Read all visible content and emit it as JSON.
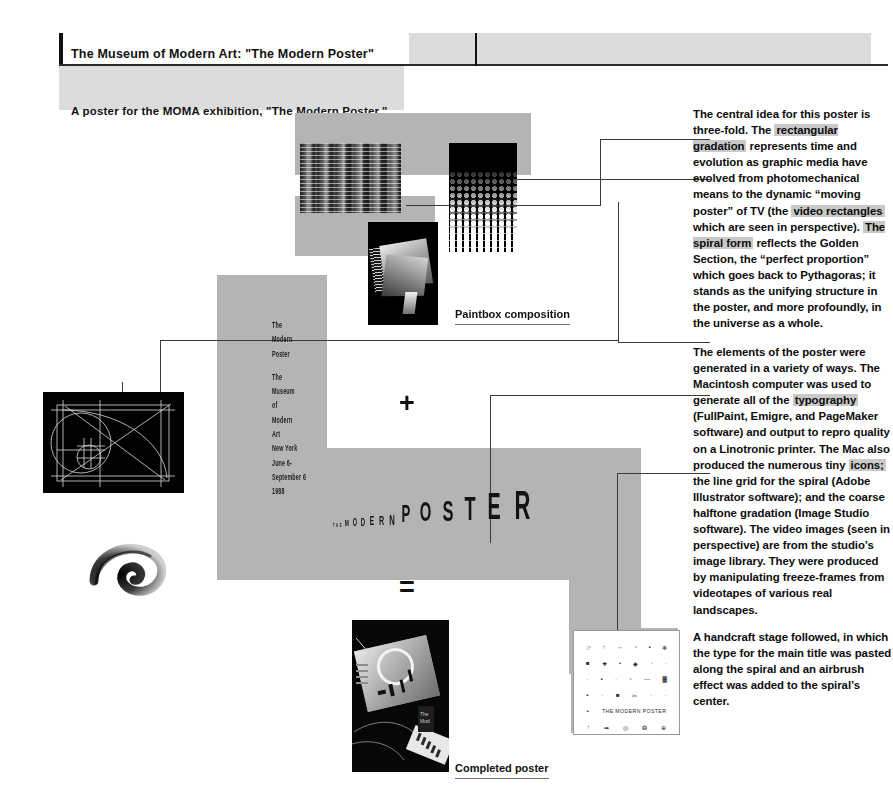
{
  "header": {
    "title": "The Museum of Modern Art: \"The Modern Poster\"",
    "subtitle": "A poster for the MOMA exhibition, \"The Modern Poster.\""
  },
  "body_text": {
    "paragraph_1": {
      "runs": [
        {
          "text": "The central idea for this poster is three-fold. The ",
          "highlight": false
        },
        {
          "text": "rectangular gradation",
          "highlight": true
        },
        {
          "text": " represents time and evolution as graphic media have evolved from photomechanical means to the dynamic “moving poster” of TV (the ",
          "highlight": false
        },
        {
          "text": "video rectangles",
          "highlight": true
        },
        {
          "text": " which are seen in perspective). ",
          "highlight": false
        },
        {
          "text": "The spiral form",
          "highlight": true
        },
        {
          "text": " reflects the Golden Section, the “perfect proportion” which goes back to Pythagoras; it stands as the unifying structure in the poster, and more profoundly, in the universe as a whole.",
          "highlight": false
        }
      ]
    },
    "paragraph_2": {
      "runs": [
        {
          "text": "The elements of the poster were generated in a variety of ways. The Macintosh computer was used to generate all of the ",
          "highlight": false
        },
        {
          "text": "typography",
          "highlight": true
        },
        {
          "text": " (FullPaint, Emigre, and PageMaker software) and output to repro quality on a Linotronic printer. The Mac also produced the numerous tiny ",
          "highlight": false
        },
        {
          "text": "icons;",
          "highlight": true
        },
        {
          "text": " the line grid for the spiral (Adobe Illustrator software); and the coarse halftone gradation (Image Studio software). The video images (seen in perspective) are from the studio’s image library. They were produced by manipulating freeze-frames from videotapes of various real landscapes.",
          "highlight": false
        }
      ]
    },
    "paragraph_3": {
      "runs": [
        {
          "text": "A handcraft stage followed, in which the type for the main title was pasted along the spiral and an airbrush effect was added to the spiral’s center.",
          "highlight": false
        }
      ]
    }
  },
  "poster": {
    "vertical_type_block_1": [
      "The",
      "Modern",
      "Poster"
    ],
    "vertical_type_block_2": [
      "The",
      "Museum",
      "of",
      "Modern",
      "Art",
      "New York",
      "June 6-",
      "September 6",
      "1988"
    ],
    "big_title_letters": [
      {
        "char": "T",
        "size": 5
      },
      {
        "char": "H",
        "size": 5
      },
      {
        "char": "E",
        "size": 5
      },
      {
        "char": "M",
        "size": 9
      },
      {
        "char": "O",
        "size": 10
      },
      {
        "char": "D",
        "size": 11
      },
      {
        "char": "E",
        "size": 12
      },
      {
        "char": "R",
        "size": 13
      },
      {
        "char": "N",
        "size": 14
      },
      {
        "char": "P",
        "size": 24
      },
      {
        "char": "O",
        "size": 27
      },
      {
        "char": "S",
        "size": 30
      },
      {
        "char": "T",
        "size": 33
      },
      {
        "char": "E",
        "size": 36
      },
      {
        "char": "R",
        "size": 40
      }
    ]
  },
  "operators": {
    "plus": "+",
    "equals": "="
  },
  "captions": {
    "paintbox": "Paintbox composition",
    "completed": "Completed poster"
  },
  "icon_card": {
    "label": "THE MODERN POSTER",
    "rows": [
      [
        "☞",
        "↑",
        "↔",
        "▫",
        "▪",
        "✻"
      ],
      [
        "■",
        "❖",
        "•",
        "◆",
        "◦",
        "·"
      ],
      [
        "·",
        "▪",
        "·",
        "▫",
        "—",
        "▓"
      ],
      [
        "▪",
        "·",
        "■",
        "✂",
        "·",
        "·"
      ],
      [
        "▪",
        "",
        "",
        "",
        "",
        ""
      ],
      [
        "↑",
        "➡",
        "◎",
        "❂",
        "⊕",
        ""
      ]
    ]
  },
  "colors": {
    "page_background": "#ffffff",
    "header_gray": "#dcdcdc",
    "poster_gray": "#b4b4b4",
    "highlight_gray": "#c9c9c9",
    "rule_black": "#111111",
    "connector_line": "#3b3b3b"
  }
}
